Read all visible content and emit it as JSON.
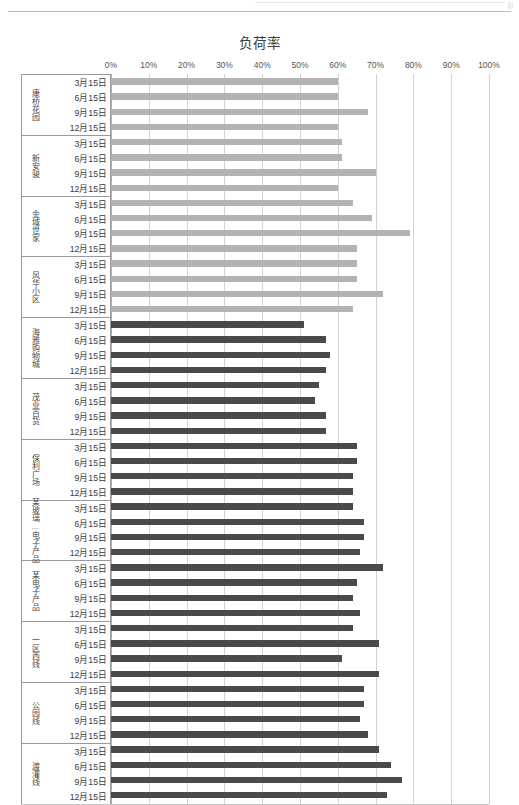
{
  "page": {
    "background_color": "#ffffff",
    "corner_mark": "|||"
  },
  "chart_data": {
    "type": "bar",
    "orientation": "horizontal",
    "title": "负荷率",
    "xlabel": "",
    "ylabel": "",
    "xlim": [
      0,
      100
    ],
    "xtick_labels": [
      "0%",
      "10%",
      "20%",
      "30%",
      "40%",
      "50%",
      "60%",
      "70%",
      "80%",
      "90%",
      "100%"
    ],
    "xtick_values": [
      0,
      10,
      20,
      30,
      40,
      50,
      60,
      70,
      80,
      90,
      100
    ],
    "grid": true,
    "legend": null,
    "colors": {
      "light_series": "#b3b3b3",
      "dark_series": "#4a4a4a",
      "grid": "#d2d2d2",
      "axis": "#b0b0b0",
      "text": "#3a3a3a"
    },
    "date_labels": [
      "3月15日",
      "6月15日",
      "9月15日",
      "12月15日"
    ],
    "groups": [
      {
        "name": "康桥花园",
        "shade": "light",
        "values": [
          60,
          60,
          68,
          60
        ]
      },
      {
        "name": "新安骏",
        "shade": "light",
        "values": [
          61,
          61,
          70,
          60
        ]
      },
      {
        "name": "金域世家",
        "shade": "light",
        "values": [
          64,
          69,
          79,
          65
        ]
      },
      {
        "name": "风华小区",
        "shade": "light",
        "values": [
          65,
          65,
          72,
          64
        ]
      },
      {
        "name": "海雅购物城",
        "shade": "dark",
        "values": [
          51,
          57,
          58,
          57
        ]
      },
      {
        "name": "茂业百货",
        "shade": "dark",
        "values": [
          55,
          54,
          57,
          57
        ]
      },
      {
        "name": "保利广场",
        "shade": "dark",
        "values": [
          65,
          65,
          64,
          64
        ]
      },
      {
        "name": "某玻璃…电子产品",
        "shade": "dark",
        "values": [
          64,
          67,
          67,
          66
        ]
      },
      {
        "name": "某电子产品",
        "shade": "dark",
        "values": [
          72,
          65,
          64,
          66
        ]
      },
      {
        "name": "一区西线",
        "shade": "dark",
        "values": [
          64,
          71,
          61,
          71
        ]
      },
      {
        "name": "公园线",
        "shade": "dark",
        "values": [
          67,
          67,
          66,
          68
        ]
      },
      {
        "name": "渡灌线",
        "shade": "dark",
        "values": [
          71,
          74,
          77,
          73
        ]
      }
    ]
  }
}
